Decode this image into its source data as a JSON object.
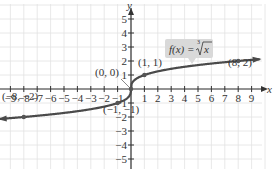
{
  "chart_data": {
    "type": "line",
    "title": "",
    "function_label": "f(x) = ∛x",
    "function_label_parts": {
      "lhs": "f(x) = ",
      "radical_index": "3",
      "radicand": "x"
    },
    "xlabel": "x",
    "ylabel": "y",
    "xlim": [
      -9.8,
      10
    ],
    "ylim": [
      -6,
      6
    ],
    "grid": true,
    "x_ticks": [
      -9,
      -8,
      -7,
      -6,
      -5,
      -4,
      -3,
      -2,
      -1,
      1,
      2,
      3,
      4,
      5,
      6,
      7,
      8,
      9
    ],
    "y_ticks": [
      -5,
      -4,
      -3,
      -2,
      -1,
      1,
      2,
      3,
      4,
      5
    ],
    "x_tick_labels": [
      "−9",
      "−8",
      "−7",
      "−6",
      "−5",
      "−4",
      "−3",
      "−2",
      "−1",
      "1",
      "2",
      "3",
      "4",
      "5",
      "6",
      "7",
      "8",
      "9"
    ],
    "y_tick_labels": [
      "−5",
      "−4",
      "−3",
      "−2",
      "−1",
      "1",
      "2",
      "3",
      "4",
      "5"
    ],
    "series": [
      {
        "name": "f(x) = cube root of x",
        "function": "cbrt",
        "x_range": [
          -9.8,
          9.6
        ]
      }
    ],
    "points": [
      {
        "x": -8,
        "y": -2,
        "label": "(−8, −2)"
      },
      {
        "x": -1,
        "y": -1,
        "label": "(−1, −1)"
      },
      {
        "x": 0,
        "y": 0,
        "label": "(0, 0)"
      },
      {
        "x": 1,
        "y": 1,
        "label": "(1, 1)"
      },
      {
        "x": 8,
        "y": 2,
        "label": "(8, 2)"
      }
    ],
    "colors": {
      "curve": "#4a4a4a",
      "grid": "#e2e2e2",
      "axis": "#333333",
      "label_box": "#d9d9d9"
    }
  }
}
